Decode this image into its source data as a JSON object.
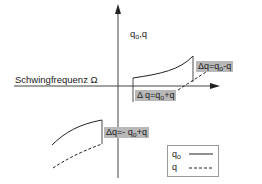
{
  "diagram": {
    "y_axis_label": {
      "base": "q",
      "sub": "o",
      "suffix": ",q"
    },
    "x_axis_label": "Schwingfrequenz  Ω",
    "annotations": [
      {
        "id": "upper-right",
        "prefix": "Δq=q",
        "sub": "o",
        "suffix": "-q"
      },
      {
        "id": "mid",
        "prefix": "Δ q=q",
        "sub": "o",
        "suffix": "+q"
      },
      {
        "id": "lower-left",
        "prefix": "Δq=- q",
        "sub": "o",
        "suffix": "+q"
      }
    ],
    "legend": {
      "items": [
        {
          "base": "q",
          "sub": "o",
          "style": "solid"
        },
        {
          "base": "q",
          "sub": "",
          "style": "dashed"
        }
      ]
    },
    "colors": {
      "line": "#222222",
      "box": "#b8b8b8",
      "axis": "#444444"
    }
  }
}
